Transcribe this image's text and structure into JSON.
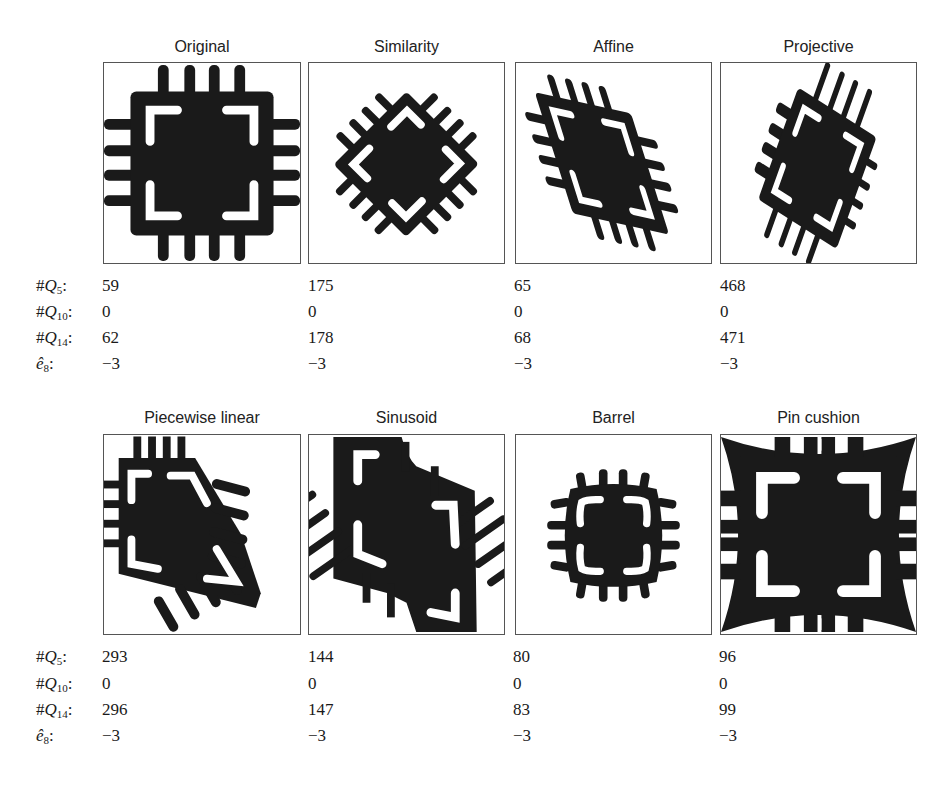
{
  "figure": {
    "rows": [
      {
        "panels": [
          {
            "title": "Original",
            "q5": "59",
            "q10": "0",
            "q14": "62",
            "e8": "−3"
          },
          {
            "title": "Similarity",
            "q5": "175",
            "q10": "0",
            "q14": "178",
            "e8": "−3"
          },
          {
            "title": "Affine",
            "q5": "65",
            "q10": "0",
            "q14": "68",
            "e8": "−3"
          },
          {
            "title": "Projective",
            "q5": "468",
            "q10": "0",
            "q14": "471",
            "e8": "−3"
          }
        ]
      },
      {
        "panels": [
          {
            "title": "Piecewise linear",
            "q5": "293",
            "q10": "0",
            "q14": "296",
            "e8": "−3"
          },
          {
            "title": "Sinusoid",
            "q5": "144",
            "q10": "0",
            "q14": "147",
            "e8": "−3"
          },
          {
            "title": "Barrel",
            "q5": "80",
            "q10": "0",
            "q14": "83",
            "e8": "−3"
          },
          {
            "title": "Pin cushion",
            "q5": "96",
            "q10": "0",
            "q14": "99",
            "e8": "−3"
          }
        ]
      }
    ],
    "stat_labels": {
      "q5": {
        "prefix": "#",
        "var": "Q",
        "sub": "5"
      },
      "q10": {
        "prefix": "#",
        "var": "Q",
        "sub": "10"
      },
      "q14": {
        "prefix": "#",
        "var": "Q",
        "sub": "14"
      },
      "e8": {
        "prefix": "",
        "var": "ê",
        "sub": "8"
      }
    },
    "colors": {
      "ink": "#1a1a1a",
      "frame": "#555555",
      "paper": "#ffffff"
    }
  }
}
